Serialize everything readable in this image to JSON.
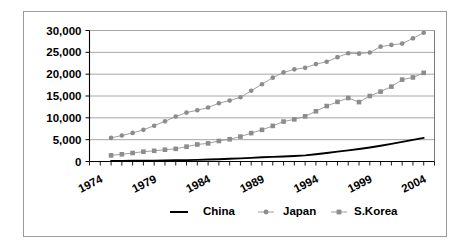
{
  "chart_data": {
    "type": "line",
    "title": "",
    "subtitle": "",
    "xlabel": "",
    "ylabel": "",
    "xlim": [
      1974,
      2006
    ],
    "ylim": [
      0,
      30000
    ],
    "grid": true,
    "legend_position": "bottom",
    "y_ticks": [
      "0",
      "5,000",
      "10,000",
      "15,000",
      "20,000",
      "25,000",
      "30,000"
    ],
    "y_tick_values": [
      0,
      5000,
      10000,
      15000,
      20000,
      25000,
      30000
    ],
    "x_ticks": [
      "1974",
      "1979",
      "1984",
      "1989",
      "1994",
      "1999",
      "2004"
    ],
    "x_tick_values": [
      1974,
      1979,
      1984,
      1989,
      1994,
      1999,
      2004
    ],
    "x": [
      1976,
      1977,
      1978,
      1979,
      1980,
      1981,
      1982,
      1983,
      1984,
      1985,
      1986,
      1987,
      1988,
      1989,
      1990,
      1991,
      1992,
      1993,
      1994,
      1995,
      1996,
      1997,
      1998,
      1999,
      2000,
      2001,
      2002,
      2003,
      2004,
      2005
    ],
    "series": [
      {
        "name": "China",
        "marker": "none",
        "color": "#000000",
        "values": [
          120,
          140,
          160,
          185,
          210,
          240,
          275,
          320,
          380,
          450,
          530,
          620,
          720,
          840,
          980,
          1060,
          1150,
          1250,
          1400,
          1650,
          1950,
          2250,
          2550,
          2850,
          3200,
          3600,
          4050,
          4500,
          4950,
          5400
        ]
      },
      {
        "name": "Japan",
        "marker": "circle",
        "color": "#8c8c8c",
        "values": [
          5400,
          5950,
          6550,
          7250,
          8200,
          9200,
          10300,
          11200,
          11750,
          12350,
          13350,
          13950,
          14700,
          16200,
          17700,
          19200,
          20400,
          21100,
          21450,
          22300,
          22850,
          23900,
          24800,
          24700,
          24950,
          26300,
          26700,
          27000,
          28200,
          29500
        ]
      },
      {
        "name": "S.Korea",
        "marker": "square",
        "color": "#8c8c8c",
        "values": [
          1400,
          1650,
          1950,
          2250,
          2450,
          2700,
          2900,
          3400,
          3900,
          4150,
          4700,
          5100,
          5700,
          6500,
          7250,
          8150,
          9150,
          9650,
          10350,
          11500,
          12700,
          13650,
          14550,
          13600,
          15000,
          16000,
          17150,
          18750,
          19250,
          20300
        ]
      }
    ],
    "legend": [
      {
        "label": "China",
        "marker": "line",
        "color": "#000000"
      },
      {
        "label": "Japan",
        "marker": "circle",
        "color": "#8c8c8c"
      },
      {
        "label": "S.Korea",
        "marker": "square",
        "color": "#8c8c8c"
      }
    ]
  }
}
